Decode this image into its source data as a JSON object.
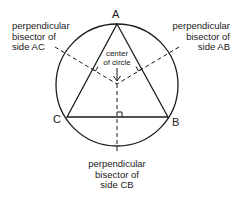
{
  "diagram": {
    "vertices": {
      "A": "A",
      "B": "B",
      "C": "C"
    },
    "labels": {
      "bisector_ac": "perpendicular\nbisector of\nside AC",
      "bisector_ab": "perpendicular\nbisector of\nside AB",
      "bisector_cb": "perpendicular\nbisector of\nside CB",
      "center": "center\nof circle"
    },
    "colors": {
      "stroke": "#1a1a1a",
      "background": "#ffffff"
    }
  }
}
